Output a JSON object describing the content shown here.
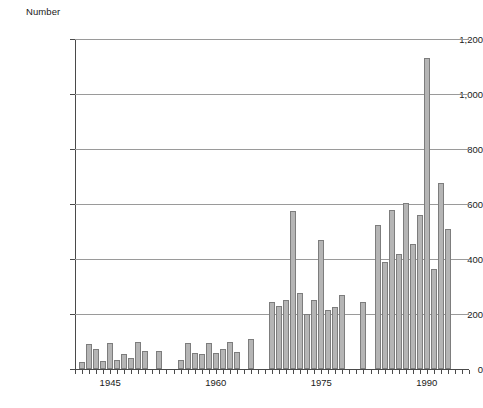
{
  "chart_data": {
    "type": "bar",
    "title": "",
    "subtitle": "",
    "ylabel": "Number",
    "xlabel": "",
    "ylim": [
      0,
      1200
    ],
    "grid": true,
    "legend": null,
    "y_ticks": [
      0,
      200,
      400,
      600,
      800,
      1000,
      1200
    ],
    "y_tick_labels": [
      "0",
      "200",
      "400",
      "600",
      "800",
      "1,000",
      "1,200"
    ],
    "x_ticks": [
      1945,
      1960,
      1975,
      1990
    ],
    "x_tick_labels": [
      "1945",
      "1960",
      "1975",
      "1990"
    ],
    "x_range": [
      1940,
      1996
    ],
    "categories": [
      1941,
      1942,
      1943,
      1944,
      1945,
      1946,
      1947,
      1948,
      1949,
      1950,
      1952,
      1955,
      1956,
      1957,
      1958,
      1959,
      1960,
      1961,
      1962,
      1963,
      1965,
      1968,
      1969,
      1970,
      1971,
      1972,
      1973,
      1974,
      1975,
      1976,
      1977,
      1978,
      1979,
      1981,
      1983,
      1984,
      1985,
      1986,
      1987,
      1988,
      1989,
      1990,
      1991,
      1992,
      1993,
      1994
    ],
    "values": [
      25,
      90,
      72,
      30,
      93,
      33,
      55,
      40,
      98,
      65,
      65,
      33,
      93,
      60,
      55,
      95,
      58,
      72,
      100,
      62,
      110,
      245,
      230,
      250,
      575,
      275,
      200,
      250,
      470,
      215,
      225,
      270,
      0,
      245,
      525,
      390,
      580,
      420,
      605,
      455,
      560,
      1130,
      365,
      675,
      510,
      0
    ],
    "bar_color": "#b5b5b5",
    "bar_edge_color": "#7d7d7d",
    "grid_color": "#9a9a9a",
    "axis_color": "#4a4a4a"
  },
  "caption": {
    "text": ""
  }
}
